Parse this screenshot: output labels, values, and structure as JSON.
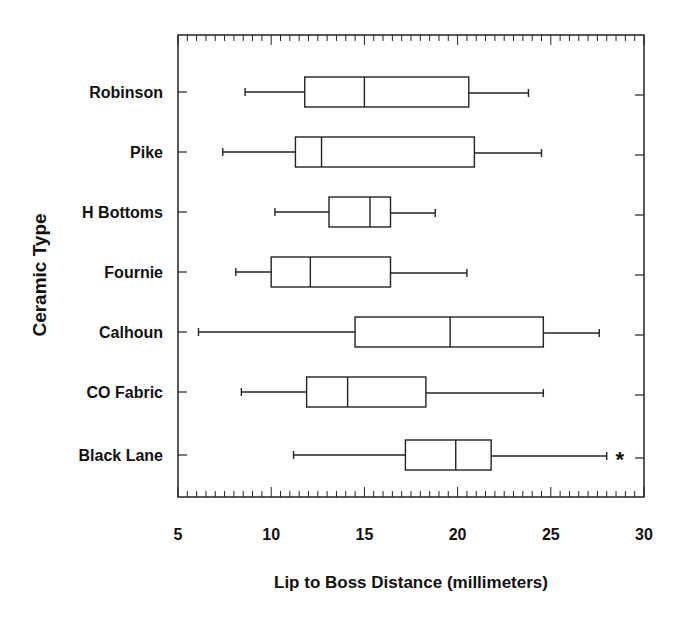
{
  "chart_data": {
    "type": "boxplot",
    "orientation": "horizontal",
    "title": "",
    "xlabel": "Lip to Boss Distance (millimeters)",
    "ylabel": "Ceramic Type",
    "xlim": [
      5,
      30
    ],
    "xticks": [
      5,
      10,
      15,
      20,
      25,
      30
    ],
    "minor_tick_step": 0.5,
    "grid": false,
    "categories": [
      "Robinson",
      "Pike",
      "H Bottoms",
      "Fournie",
      "Calhoun",
      "CO Fabric",
      "Black Lane"
    ],
    "series": [
      {
        "name": "Robinson",
        "whisker_low": 8.6,
        "q1": 11.8,
        "median": 15.0,
        "q3": 20.6,
        "whisker_high": 23.8,
        "outliers": []
      },
      {
        "name": "Pike",
        "whisker_low": 7.4,
        "q1": 11.3,
        "median": 12.7,
        "q3": 20.9,
        "whisker_high": 24.5,
        "outliers": []
      },
      {
        "name": "H Bottoms",
        "whisker_low": 10.2,
        "q1": 13.1,
        "median": 15.3,
        "q3": 16.4,
        "whisker_high": 18.8,
        "outliers": []
      },
      {
        "name": "Fournie",
        "whisker_low": 8.1,
        "q1": 10.0,
        "median": 12.1,
        "q3": 16.4,
        "whisker_high": 20.5,
        "outliers": []
      },
      {
        "name": "Calhoun",
        "whisker_low": 6.1,
        "q1": 14.5,
        "median": 19.6,
        "q3": 24.6,
        "whisker_high": 27.6,
        "outliers": []
      },
      {
        "name": "CO Fabric",
        "whisker_low": 8.4,
        "q1": 11.9,
        "median": 14.1,
        "q3": 18.3,
        "whisker_high": 24.6,
        "outliers": []
      },
      {
        "name": "Black Lane",
        "whisker_low": 11.2,
        "q1": 17.2,
        "median": 19.9,
        "q3": 21.8,
        "whisker_high": 28.0,
        "outliers": [
          28.7
        ]
      }
    ],
    "outlier_marker": "*"
  }
}
